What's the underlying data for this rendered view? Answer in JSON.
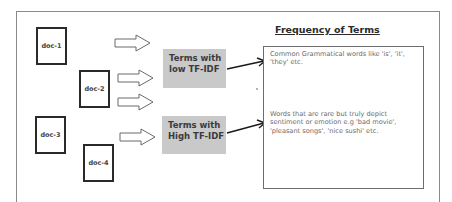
{
  "diagram": {
    "title": "Frequency of Terms",
    "documents": [
      {
        "label": "doc-1"
      },
      {
        "label": "doc-2"
      },
      {
        "label": "doc-3"
      },
      {
        "label": "doc-4"
      }
    ],
    "categories": [
      {
        "line1": "Terms with",
        "line2": "low TF-IDF"
      },
      {
        "line1": "Terms with",
        "line2": "High TF-IDF"
      }
    ],
    "descriptions": [
      {
        "lines": [
          "Common Grammatical words like 'is', 'it',",
          "'they' etc."
        ]
      },
      {
        "lines": [
          "Words that are rare but truly depict",
          "sentiment or emotion e.g 'bad movie',",
          "'pleasant songs', 'nice sushi' etc."
        ]
      }
    ],
    "colors": {
      "category_fill": "#c9c9c9",
      "doc_border": "#2a2a2a",
      "arrow_outline": "#555555",
      "connector": "#1a1a1a"
    }
  }
}
